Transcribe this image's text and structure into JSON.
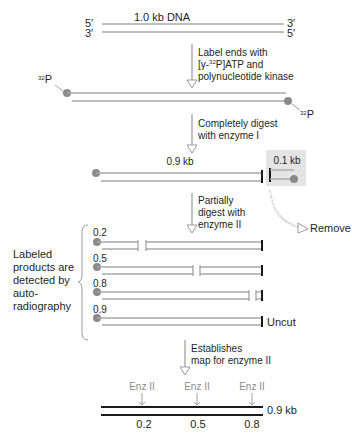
{
  "step0": {
    "title": "1.0 kb DNA",
    "top_left_end": "5′",
    "bottom_left_end": "3′",
    "top_right_end": "3′",
    "bottom_right_end": "5′"
  },
  "step1": {
    "arrow_text": [
      "Label ends with",
      "[γ-",
      "32",
      "P]ATP and",
      "polynucleotide kinase"
    ],
    "label_left": {
      "sup": "32",
      "text": "P"
    },
    "label_right": {
      "sup": "32",
      "text": "P"
    }
  },
  "step2": {
    "arrow_text": [
      "Completely digest",
      "with enzyme I"
    ],
    "large_fragment": "0.9 kb",
    "small_fragment": "0.1 kb",
    "remove_label": "Remove"
  },
  "step3": {
    "arrow_text": [
      "Partially",
      "digest with",
      "enzyme II"
    ],
    "side_label": [
      "Labeled",
      "products are",
      "detected by",
      "auto-",
      "radiography"
    ],
    "products": [
      {
        "size": "0.2",
        "cut_x": 0.2
      },
      {
        "size": "0.5",
        "cut_x": 0.5
      },
      {
        "size": "0.8",
        "cut_x": 0.8
      },
      {
        "size": "0.9",
        "uncut_label": "Uncut"
      }
    ]
  },
  "step4": {
    "arrow_text": [
      "Establishes",
      "map for enzyme II"
    ]
  },
  "map": {
    "sites": [
      {
        "enzyme": "Enz II",
        "position": "0.2"
      },
      {
        "enzyme": "Enz II",
        "position": "0.5"
      },
      {
        "enzyme": "Enz II",
        "position": "0.8"
      }
    ],
    "length_label": "0.9 kb"
  },
  "colors": {
    "strand": "#a8a8a8",
    "dark": "#1a1a1a",
    "dot": "#8a8a8a",
    "remove_box": "#e4e4e4",
    "enzyme_label": "#8c8c8c"
  }
}
